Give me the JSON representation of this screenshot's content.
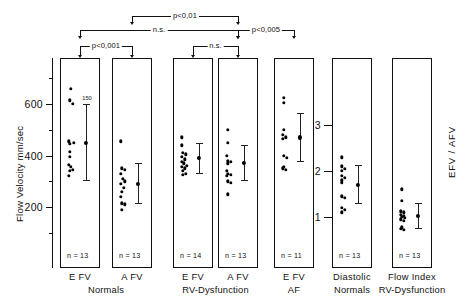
{
  "figure": {
    "left_axis_label": "Flow Velocity  mm/sec",
    "right_axis_label": "EFV / AFV"
  },
  "left_axis": {
    "tick_labels": [
      "600",
      "400",
      "200"
    ],
    "tick_values": [
      600,
      400,
      200
    ],
    "minor_ticks": [
      700,
      500,
      300,
      100
    ],
    "range": [
      0,
      760
    ]
  },
  "right_axis": {
    "tick_labels": [
      "3",
      "2",
      "1"
    ],
    "tick_values": [
      3,
      2,
      1
    ],
    "range": [
      0,
      3.8
    ]
  },
  "groups": [
    {
      "column_label": "E  FV",
      "group_label": "Normals",
      "n_label": "n = 13",
      "sd_label": "150"
    },
    {
      "column_label": "A  FV",
      "group_label": "Normals",
      "n_label": "n = 13",
      "sd_label": ""
    },
    {
      "column_label": "E  FV",
      "group_label": "RV-Dysfunction",
      "n_label": "n = 14",
      "sd_label": ""
    },
    {
      "column_label": "A  FV",
      "group_label": "RV-Dysfunction",
      "n_label": "n = 13",
      "sd_label": ""
    },
    {
      "column_label": "E  FV",
      "group_label": "AF",
      "n_label": "n = 11",
      "sd_label": ""
    },
    {
      "column_label": "Diastolic",
      "group_label": "Normals",
      "n_label": "n = 13",
      "sd_label": ""
    },
    {
      "column_label": "Flow Index",
      "group_label": "RV-Dysfunction",
      "n_label": "n = 13",
      "sd_label": ""
    }
  ],
  "significance": [
    {
      "label": "p<0,001",
      "from": 0,
      "to": 1,
      "level": 1
    },
    {
      "label": "n.s.",
      "from": 2,
      "to": 3,
      "level": 1
    },
    {
      "label": "n.s.",
      "from": 0,
      "to": 3,
      "level": 2
    },
    {
      "label": "p<0,005",
      "from": 3,
      "to": 4,
      "level": 2
    },
    {
      "label": "p<0,01",
      "from": 1,
      "to": 3,
      "level": 3
    }
  ],
  "chart_data": {
    "type": "scatter",
    "title": "",
    "xlabel": "",
    "ylabel": "Flow Velocity  mm/sec",
    "ylabel_right": "EFV / AFV",
    "ylim": [
      0,
      760
    ],
    "ylim_right": [
      0,
      3.8
    ],
    "grid": false,
    "legend": "none",
    "series": [
      {
        "name": "E FV Normals",
        "axis": "left",
        "n": 13,
        "values": [
          660,
          615,
          600,
          455,
          450,
          445,
          415,
          395,
          365,
          355,
          345,
          340,
          320
        ],
        "mean": 450,
        "sd": 150
      },
      {
        "name": "A FV Normals",
        "axis": "left",
        "n": 13,
        "values": [
          455,
          350,
          345,
          330,
          310,
          300,
          290,
          275,
          260,
          240,
          215,
          210,
          190
        ],
        "mean": 290,
        "sd": 80
      },
      {
        "name": "E FV RV-Dysfunction",
        "axis": "left",
        "n": 14,
        "values": [
          470,
          440,
          410,
          405,
          395,
          385,
          375,
          370,
          360,
          355,
          350,
          340,
          330,
          325
        ],
        "mean": 390,
        "sd": 60
      },
      {
        "name": "A FV RV-Dysfunction",
        "axis": "left",
        "n": 13,
        "values": [
          500,
          450,
          400,
          380,
          375,
          370,
          340,
          330,
          325,
          320,
          300,
          295,
          250
        ],
        "mean": 370,
        "sd": 70
      },
      {
        "name": "E FV AF",
        "axis": "left",
        "n": 11,
        "values": [
          625,
          605,
          500,
          480,
          470,
          465,
          400,
          390,
          355,
          350,
          345
        ],
        "mean": 470,
        "sd": 95
      },
      {
        "name": "Diastolic Flow Index Normals",
        "axis": "right",
        "n": 13,
        "values": [
          2.3,
          2.1,
          2.05,
          2.0,
          1.9,
          1.85,
          1.8,
          1.75,
          1.45,
          1.42,
          1.2,
          1.15,
          1.1
        ],
        "mean": 1.7,
        "sd": 0.42
      },
      {
        "name": "Diastolic Flow Index RV-Dysfunction",
        "axis": "right",
        "n": 13,
        "values": [
          1.6,
          1.35,
          1.12,
          1.1,
          1.05,
          1.02,
          1.0,
          0.98,
          0.95,
          0.92,
          0.78,
          0.75,
          0.72
        ],
        "mean": 1.02,
        "sd": 0.28
      }
    ]
  }
}
